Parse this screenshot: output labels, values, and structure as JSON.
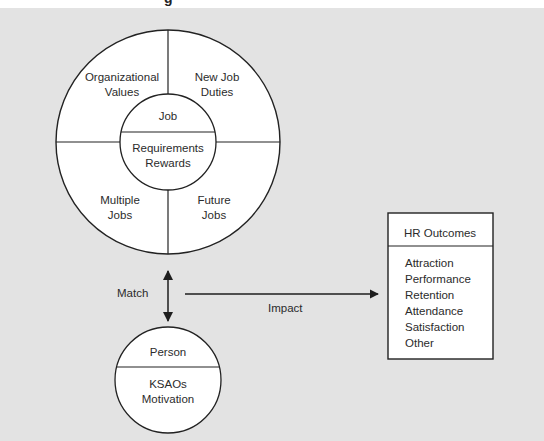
{
  "header": {
    "title_fragment": "g"
  },
  "diagram": {
    "job_wheel": {
      "center_label": "Job",
      "center_sublabels": [
        "Requirements",
        "Rewards"
      ],
      "quadrants": [
        {
          "position": "top-left",
          "lines": [
            "Organizational",
            "Values"
          ]
        },
        {
          "position": "top-right",
          "lines": [
            "New Job",
            "Duties"
          ]
        },
        {
          "position": "bottom-left",
          "lines": [
            "Multiple",
            "Jobs"
          ]
        },
        {
          "position": "bottom-right",
          "lines": [
            "Future",
            "Jobs"
          ]
        }
      ]
    },
    "match_label": "Match",
    "impact_label": "Impact",
    "person": {
      "title": "Person",
      "lines": [
        "KSAOs",
        "Motivation"
      ]
    },
    "hr_outcomes": {
      "title": "HR Outcomes",
      "items": [
        "Attraction",
        "Performance",
        "Retention",
        "Attendance",
        "Satisfaction",
        "Other"
      ]
    }
  },
  "colors": {
    "background": "#e3e3e3",
    "shape_fill": "#ffffff",
    "stroke": "#222222",
    "text": "#2b2b2b"
  }
}
